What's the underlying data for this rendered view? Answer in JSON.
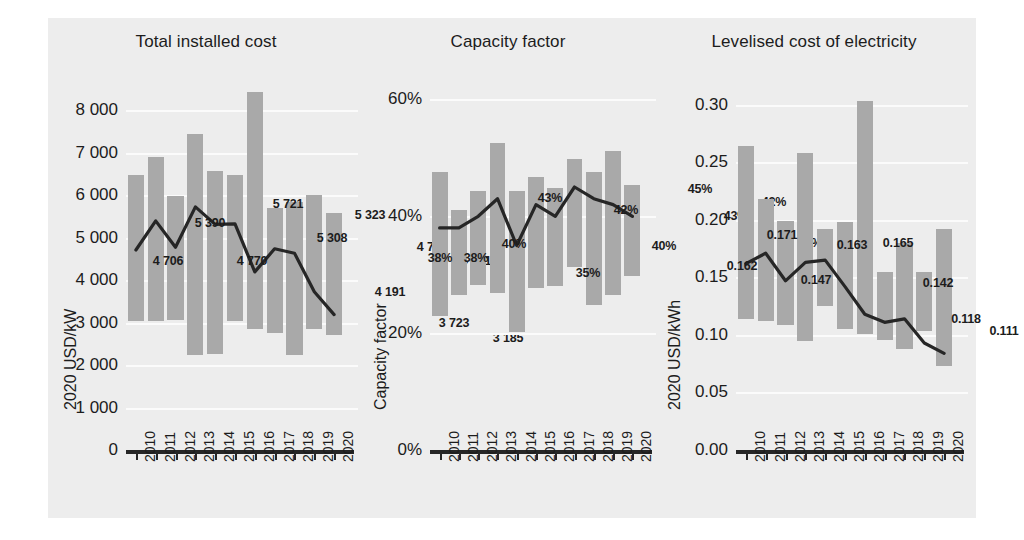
{
  "figure": {
    "background": "#ededed",
    "bar_color": "#a9a9a9",
    "line_color": "#262626",
    "grid_color": "#fbfbfb"
  },
  "chart_data": [
    {
      "type": "bar",
      "title": "Total installed cost",
      "ylabel": "2020 USD/kW",
      "xlabel": "",
      "categories": [
        "2010",
        "2011",
        "2012",
        "2013",
        "2014",
        "2015",
        "2016",
        "2017",
        "2018",
        "2019",
        "2020"
      ],
      "ytick_labels": [
        "0",
        "1 000",
        "2 000",
        "3 000",
        "4 000",
        "5 000",
        "6 000",
        "7 000",
        "8 000"
      ],
      "ytick_values": [
        0,
        1000,
        2000,
        3000,
        4000,
        5000,
        6000,
        7000,
        8000
      ],
      "ylim": [
        0,
        8800
      ],
      "grid": true,
      "legend": "none",
      "series": [
        {
          "name": "Weighted average",
          "type": "line",
          "values": [
            4706,
            5390,
            4770,
            5721,
            5308,
            5323,
            4191,
            4735,
            4631,
            3723,
            3185
          ],
          "data_labels": [
            "4 706",
            "5 390",
            "4 770",
            "5 721",
            "5 308",
            "5 323",
            "4 191",
            "4 735",
            "4 631",
            "3 723",
            "3 185"
          ]
        },
        {
          "name": "5th and 95th percentile range",
          "type": "range-bar",
          "low": [
            3030,
            3040,
            3060,
            2230,
            2260,
            3030,
            2850,
            2760,
            2230,
            2850,
            2700
          ],
          "high": [
            6460,
            6890,
            5970,
            7430,
            6560,
            6480,
            8420,
            5690,
            5830,
            5990,
            5580
          ]
        }
      ]
    },
    {
      "type": "bar",
      "title": "Capacity factor",
      "ylabel": "Capacity factor",
      "xlabel": "",
      "categories": [
        "2010",
        "2011",
        "2012",
        "2013",
        "2014",
        "2015",
        "2016",
        "2017",
        "2018",
        "2019",
        "2020"
      ],
      "ytick_labels": [
        "0%",
        "20%",
        "40%",
        "60%"
      ],
      "ytick_values": [
        0,
        20,
        40,
        60
      ],
      "ylim": [
        0,
        64
      ],
      "grid": true,
      "legend": "none",
      "series": [
        {
          "name": "Weighted average",
          "type": "line",
          "values": [
            38,
            38,
            40,
            43,
            35,
            42,
            40,
            45,
            43,
            42,
            40
          ],
          "data_labels": [
            "38%",
            "38%",
            "40%",
            "43%",
            "35%",
            "42%",
            "40%",
            "45%",
            "43%",
            "42%",
            "40%"
          ]
        },
        {
          "name": "5th and 95th percentile range",
          "type": "range-bar",
          "low": [
            23.0,
            26.6,
            28.3,
            26.9,
            20.2,
            27.8,
            28.1,
            31.3,
            24.8,
            26.5,
            29.8
          ],
          "high": [
            47.5,
            41.1,
            44.4,
            52.5,
            44.4,
            46.7,
            44.8,
            49.8,
            47.5,
            51.2,
            45.3
          ]
        }
      ]
    },
    {
      "type": "bar",
      "title": "Levelised cost of electricity",
      "ylabel": "2020 USD/kWh",
      "xlabel": "",
      "categories": [
        "2010",
        "2011",
        "2012",
        "2013",
        "2014",
        "2015",
        "2016",
        "2017",
        "2018",
        "2019",
        "2020"
      ],
      "ytick_labels": [
        "0.00",
        "0.05",
        "0.10",
        "0.15",
        "0.20",
        "0.25",
        "0.30"
      ],
      "ytick_values": [
        0.0,
        0.05,
        0.1,
        0.15,
        0.2,
        0.25,
        0.3
      ],
      "ylim": [
        0,
        0.325
      ],
      "grid": true,
      "legend": "none",
      "series": [
        {
          "name": "Weighted average",
          "type": "line",
          "values": [
            0.162,
            0.171,
            0.147,
            0.163,
            0.165,
            0.142,
            0.118,
            0.111,
            0.114,
            0.093,
            0.084
          ],
          "data_labels": [
            "0.162",
            "0.171",
            "0.147",
            "0.163",
            "0.165",
            "0.142",
            "0.118",
            "0.111",
            "0.093",
            "0.084",
            "0.114"
          ]
        },
        {
          "name": "5th and 95th percentile range",
          "type": "range-bar",
          "low": [
            0.114,
            0.112,
            0.109,
            0.095,
            0.125,
            0.105,
            0.101,
            0.096,
            0.088,
            0.103,
            0.073
          ],
          "high": [
            0.264,
            0.218,
            0.199,
            0.258,
            0.192,
            0.198,
            0.303,
            0.155,
            0.18,
            0.155,
            0.192
          ]
        }
      ]
    }
  ],
  "labels": {
    "chart1_value_labels": [
      {
        "text": "4 706",
        "x": 62,
        "y": 243
      },
      {
        "text": "5 390",
        "x": 104,
        "y": 205
      },
      {
        "text": "4 770",
        "x": 146,
        "y": 243
      },
      {
        "text": "5 721",
        "x": 182,
        "y": 186
      },
      {
        "text": "5 308",
        "x": 226,
        "y": 220
      },
      {
        "text": "5 323",
        "x": 264,
        "y": 197
      },
      {
        "text": "4 191",
        "x": 284,
        "y": 274
      },
      {
        "text": "4 735",
        "x": 326,
        "y": 229
      },
      {
        "text": "4 631",
        "x": 370,
        "y": 243
      },
      {
        "text": "3 723",
        "x": 348,
        "y": 305
      },
      {
        "text": "3 185",
        "x": 402,
        "y": 320
      }
    ],
    "chart2_value_labels": [
      {
        "text": "38%",
        "x": 30,
        "y": 240
      },
      {
        "text": "38%",
        "x": 66,
        "y": 240
      },
      {
        "text": "40%",
        "x": 104,
        "y": 226
      },
      {
        "text": "43%",
        "x": 140,
        "y": 180
      },
      {
        "text": "35%",
        "x": 178,
        "y": 255
      },
      {
        "text": "42%",
        "x": 216,
        "y": 192
      },
      {
        "text": "40%",
        "x": 254,
        "y": 228
      },
      {
        "text": "45%",
        "x": 290,
        "y": 171
      },
      {
        "text": "43%",
        "x": 326,
        "y": 198
      },
      {
        "text": "42%",
        "x": 364,
        "y": 184
      },
      {
        "text": "40%",
        "x": 400,
        "y": 225
      }
    ],
    "chart3_value_labels": [
      {
        "text": "0.162",
        "x": 26,
        "y": 248
      },
      {
        "text": "0.171",
        "x": 66,
        "y": 217
      },
      {
        "text": "0.147",
        "x": 100,
        "y": 262
      },
      {
        "text": "0.163",
        "x": 136,
        "y": 227
      },
      {
        "text": "0.165",
        "x": 182,
        "y": 225
      },
      {
        "text": "0.142",
        "x": 222,
        "y": 265
      },
      {
        "text": "0.118",
        "x": 250,
        "y": 301
      },
      {
        "text": "0.111",
        "x": 288,
        "y": 313
      },
      {
        "text": "0.114",
        "x": 326,
        "y": 291
      },
      {
        "text": "0.093",
        "x": 348,
        "y": 336
      },
      {
        "text": "0.084",
        "x": 398,
        "y": 348
      }
    ]
  }
}
